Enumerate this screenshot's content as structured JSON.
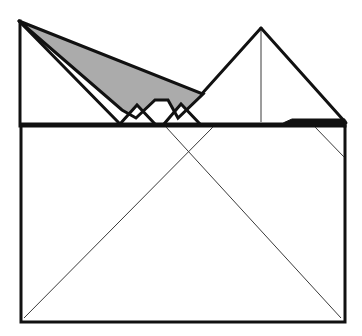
{
  "figure": {
    "canvas": {
      "width": 362,
      "height": 336,
      "background": "#ffffff"
    },
    "colors": {
      "stroke_heavy": "#111111",
      "stroke_light": "#3a3a3a",
      "shaded_fill": "#ababab",
      "paper_fill": "#ffffff"
    },
    "stroke_widths": {
      "heavy": 3.0,
      "medium": 2.2,
      "light": 1.0
    },
    "shapes": {
      "base_rectangle": {
        "name": "base-rectangle",
        "points": "21,126 345,126 345,322 21,322"
      },
      "left_upper_edge": {
        "name": "left-upper-edge",
        "points": "20,21 20,126"
      },
      "right_upper_edge": {
        "name": "right-upper-edge",
        "points": "345,126 345,122"
      },
      "upper_band": {
        "name": "upper-horizontal-band",
        "points": "21,123 283,123 292,119 345,119 345,126 21,126"
      },
      "right_peak": {
        "name": "right-peak-triangle",
        "points": "261,28 200,96 345,122"
      },
      "right_peak_left_leg": {
        "name": "right-peak-left-leg",
        "points": "261,28 199,97"
      },
      "right_peak_right_leg": {
        "name": "right-peak-right-leg",
        "points": "261,28 346,123"
      },
      "right_peak_center_line": {
        "name": "right-peak-center-line",
        "points": "261,30 261,122"
      },
      "shaded_flap": {
        "name": "shaded-flap-polygon",
        "points": "19,21 203,94 178,118 168,100 155,100 136,118 122,110"
      },
      "shaded_flap_outline": {
        "name": "shaded-flap-outline",
        "points": "19,21 203,94 178,118 168,100 155,100 136,118 122,110 19,21"
      },
      "left_fold_leg": {
        "name": "left-fold-lower-leg",
        "points": "19,21 120,124"
      },
      "left_notch_triangle": {
        "name": "left-notch-white-triangle",
        "points": "120,124 137,105 155,124"
      },
      "right_notch_triangle": {
        "name": "right-notch-white-triangle",
        "points": "164,124 181,104 200,124"
      },
      "band_fold_left": {
        "name": "band-fold-line-left",
        "points": "155,100 168,100"
      },
      "diag_left_down": {
        "name": "diagonal-left-descending",
        "points": "213,127 24,318"
      },
      "diag_right_down": {
        "name": "diagonal-right-descending",
        "points": "166,127 341,318"
      },
      "right_corner_diag": {
        "name": "right-corner-short-diagonal",
        "points": "315,127 344,157"
      }
    }
  }
}
